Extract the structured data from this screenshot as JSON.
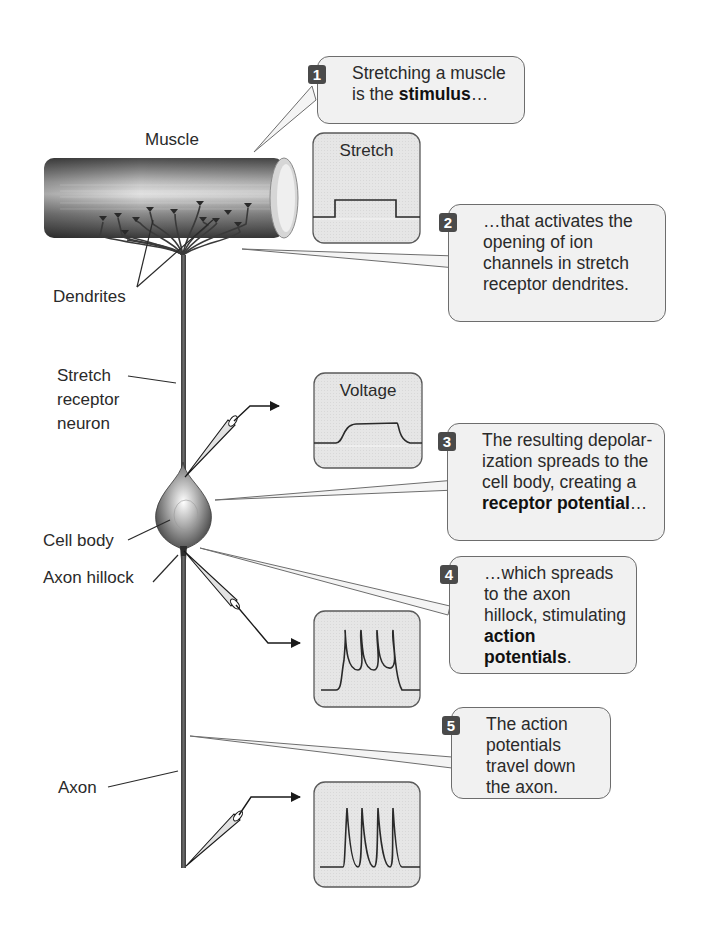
{
  "labels": {
    "muscle": "Muscle",
    "dendrites": "Dendrites",
    "stretch_receptor_neuron": [
      "Stretch",
      "receptor",
      "neuron"
    ],
    "cell_body": "Cell body",
    "axon_hillock": "Axon hillock",
    "axon": "Axon"
  },
  "scopes": [
    {
      "id": "stretch",
      "title": "Stretch",
      "trace": "step"
    },
    {
      "id": "voltage",
      "title": "Voltage",
      "trace": "receptor-potential"
    },
    {
      "id": "ap1",
      "title": "",
      "trace": "action-potentials-on-plateau"
    },
    {
      "id": "ap2",
      "title": "",
      "trace": "action-potentials"
    }
  ],
  "callouts": [
    {
      "num": "1",
      "parts": [
        {
          "t": "Stretching a muscle is the "
        },
        {
          "b": "stimulus"
        },
        {
          "t": "…"
        }
      ]
    },
    {
      "num": "2",
      "parts": [
        {
          "t": "…that activates the opening of ion channels in stretch receptor dendrites."
        }
      ]
    },
    {
      "num": "3",
      "parts": [
        {
          "t": "The resulting depolar-ization spreads to the cell body, creating a "
        },
        {
          "b": "receptor potential"
        },
        {
          "t": "…"
        }
      ]
    },
    {
      "num": "4",
      "parts": [
        {
          "t": "…which spreads to the axon hillock, stimulating "
        },
        {
          "b": "action potentials"
        },
        {
          "t": "."
        }
      ]
    },
    {
      "num": "5",
      "parts": [
        {
          "t": "The action potentials travel down the axon."
        }
      ]
    }
  ],
  "colors": {
    "callout_bg": "#f1f1f1",
    "callout_border": "#6d6d6d",
    "scope_bg": "#e4e4e4",
    "badge": "#4a4a4a",
    "neuron": "#4c4c4c"
  }
}
